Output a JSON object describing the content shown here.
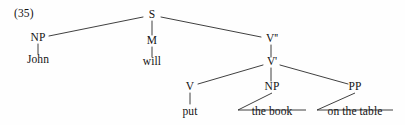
{
  "figure": {
    "example_number": "(35)",
    "sentence": "John will put the book on the table",
    "type": "phrase-structure-tree"
  },
  "nodes": {
    "s": {
      "label": "S",
      "x": 152,
      "y": 15
    },
    "np_subject": {
      "label": "NP",
      "x": 38,
      "y": 38
    },
    "m": {
      "label": "M",
      "x": 152,
      "y": 41
    },
    "v_double_bar": {
      "label": "V''",
      "x": 272,
      "y": 39
    },
    "v_single_bar": {
      "label": "V'",
      "x": 272,
      "y": 62
    },
    "v": {
      "label": "V",
      "x": 190,
      "y": 87
    },
    "np_object": {
      "label": "NP",
      "x": 272,
      "y": 87
    },
    "pp": {
      "label": "PP",
      "x": 355,
      "y": 87
    }
  },
  "terminals": {
    "john": {
      "label": "John",
      "x": 38,
      "y": 60
    },
    "will": {
      "label": "will",
      "x": 152,
      "y": 62
    },
    "put": {
      "label": "put",
      "x": 190,
      "y": 112
    },
    "the_book": {
      "label": "the book",
      "x": 272,
      "y": 112
    },
    "on_the_table": {
      "label": "on the table",
      "x": 355,
      "y": 112
    }
  },
  "colors": {
    "ink": "#141414",
    "line": "#2a2a2a",
    "background": "#fefefe"
  }
}
